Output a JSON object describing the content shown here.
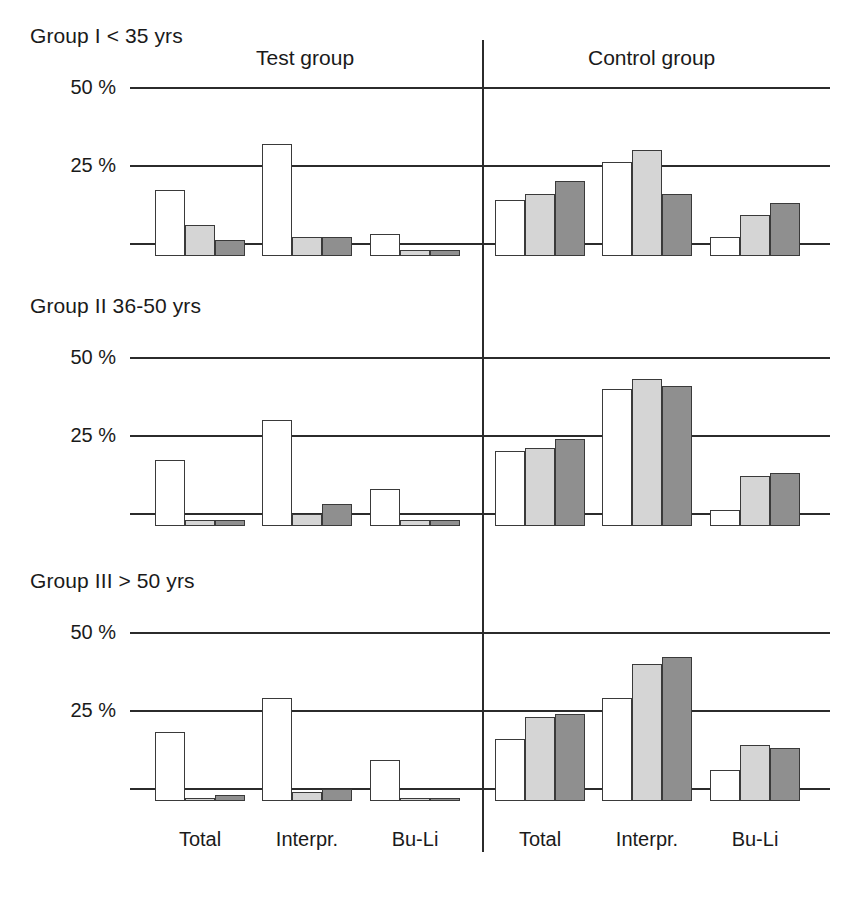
{
  "chart_data": {
    "type": "bar",
    "title": "",
    "xlabel": "",
    "ylabel": "",
    "ylim": [
      0,
      50
    ],
    "yticks": [
      25,
      50
    ],
    "ytick_labels": [
      "25 %",
      "50 %"
    ],
    "grid": true,
    "legend": "none",
    "series_names": [
      "Series 1 (white)",
      "Series 2 (light grey)",
      "Series 3 (dark grey)"
    ],
    "series_colors": [
      "#ffffff",
      "#d5d5d5",
      "#8f8f8f"
    ],
    "categories": [
      "Total",
      "Interpr.",
      "Bu-Li"
    ],
    "column_groups": [
      "Test group",
      "Control group"
    ],
    "panels": [
      {
        "title": "Group I < 35 yrs",
        "groups": [
          {
            "name": "Test group",
            "categories": [
              "Total",
              "Interpr.",
              "Bu-Li"
            ],
            "values": [
              [
                21,
                10,
                5
              ],
              [
                36,
                6,
                6
              ],
              [
                7,
                2,
                2
              ]
            ]
          },
          {
            "name": "Control group",
            "categories": [
              "Total",
              "Interpr.",
              "Bu-Li"
            ],
            "values": [
              [
                18,
                20,
                24
              ],
              [
                30,
                34,
                20
              ],
              [
                6,
                13,
                17
              ]
            ]
          }
        ]
      },
      {
        "title": "Group II 36-50 yrs",
        "groups": [
          {
            "name": "Test group",
            "categories": [
              "Total",
              "Interpr.",
              "Bu-Li"
            ],
            "values": [
              [
                21,
                2,
                2
              ],
              [
                34,
                4,
                7
              ],
              [
                12,
                2,
                2
              ]
            ]
          },
          {
            "name": "Control group",
            "categories": [
              "Total",
              "Interpr.",
              "Bu-Li"
            ],
            "values": [
              [
                24,
                25,
                28
              ],
              [
                44,
                47,
                45
              ],
              [
                5,
                16,
                17
              ]
            ]
          }
        ]
      },
      {
        "title": "Group III > 50 yrs",
        "groups": [
          {
            "name": "Test group",
            "categories": [
              "Total",
              "Interpr.",
              "Bu-Li"
            ],
            "values": [
              [
                22,
                1,
                2
              ],
              [
                33,
                3,
                4
              ],
              [
                13,
                1,
                1
              ]
            ]
          },
          {
            "name": "Control group",
            "categories": [
              "Total",
              "Interpr.",
              "Bu-Li"
            ],
            "values": [
              [
                20,
                27,
                28
              ],
              [
                33,
                44,
                46
              ],
              [
                10,
                18,
                17
              ]
            ]
          }
        ]
      }
    ]
  },
  "axis": {
    "tick_50": "50 %",
    "tick_25": "25 %"
  },
  "headers": {
    "test_group": "Test group",
    "control_group": "Control group"
  },
  "panel_titles": {
    "p1": "Group I < 35 yrs",
    "p2": "Group II 36-50 yrs",
    "p3": "Group III > 50 yrs"
  },
  "x_axis_labels": {
    "test": [
      "Total",
      "Interpr.",
      "Bu-Li"
    ],
    "control": [
      "Total",
      "Interpr.",
      "Bu-Li"
    ]
  },
  "colors": {
    "series_1": "#ffffff",
    "series_2": "#d5d5d5",
    "series_3": "#8f8f8f",
    "line": "#2b2b2b",
    "text": "#1a1a1a"
  }
}
